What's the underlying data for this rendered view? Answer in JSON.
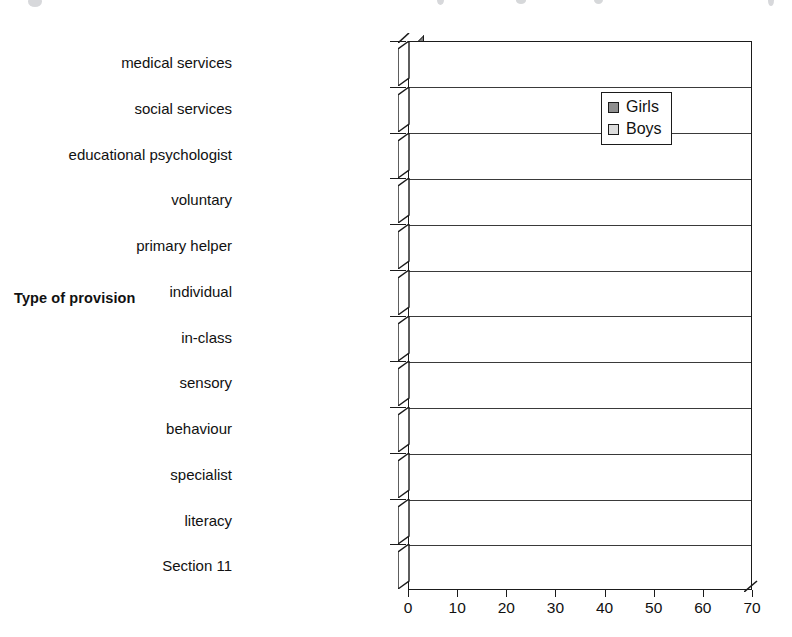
{
  "chart_data": {
    "type": "bar",
    "orientation": "horizontal",
    "title": "",
    "xlabel": "",
    "ylabel": "Type of provision",
    "xlim": [
      0,
      70
    ],
    "xticks": [
      "0",
      "10",
      "20",
      "30",
      "40",
      "50",
      "60",
      "70"
    ],
    "grid": true,
    "legend_position": "top-right",
    "categories": [
      "medical services",
      "social services",
      "educational psychologist",
      "voluntary",
      "primary helper",
      "individual",
      "in-class",
      "sensory",
      "behaviour",
      "specialist",
      "literacy",
      "Section 11"
    ],
    "series": [
      {
        "name": "Girls",
        "color": "#9a9a9a",
        "values": [
          2,
          2.5,
          2,
          11,
          6,
          5,
          38,
          1.5,
          7,
          6,
          31,
          3
        ]
      },
      {
        "name": "Boys",
        "color": "#d2d2d2",
        "values": [
          2,
          2,
          4,
          2,
          12,
          12,
          50,
          1.5,
          12,
          16,
          65,
          3
        ]
      }
    ]
  },
  "legend": {
    "items": [
      {
        "label": "Girls",
        "swatch": "girls-swatch"
      },
      {
        "label": "Boys",
        "swatch": "boys-swatch"
      }
    ]
  },
  "axes": {
    "y_title": "Type of provision"
  }
}
